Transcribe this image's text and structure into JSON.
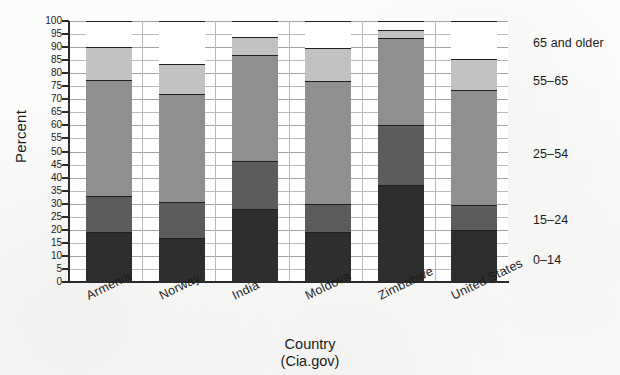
{
  "chart_data": {
    "type": "bar",
    "subtype": "stacked-bar-100-percent",
    "title": "",
    "xlabel": "Country",
    "source": "(Cia.gov)",
    "ylabel": "Percent",
    "ylim": [
      0,
      100
    ],
    "ytick_step": 5,
    "grid": true,
    "legend_position": "right",
    "categories": [
      "Armenia",
      "Norway",
      "India",
      "Moldova",
      "Zimbabwe",
      "United States"
    ],
    "series": [
      {
        "name": "0–14",
        "color": "#2e2e2e",
        "values": [
          19.0,
          17.0,
          28.0,
          19.0,
          37.0,
          20.0
        ]
      },
      {
        "name": "15–24",
        "color": "#5c5c5c",
        "values": [
          14.0,
          13.5,
          18.5,
          11.0,
          23.0,
          9.5
        ]
      },
      {
        "name": "25–54",
        "color": "#8f8f8f",
        "values": [
          44.5,
          41.5,
          40.5,
          47.0,
          33.5,
          44.0
        ]
      },
      {
        "name": "55–65",
        "color": "#c2c2c2",
        "values": [
          12.5,
          11.5,
          7.0,
          12.5,
          3.0,
          12.0
        ]
      },
      {
        "name": "65 and older",
        "color": "#ffffff",
        "values": [
          10.0,
          16.5,
          6.0,
          10.5,
          3.5,
          14.5
        ]
      }
    ],
    "cumulative_tops": {
      "Armenia": [
        19.0,
        33.0,
        77.5,
        90.0,
        100
      ],
      "Norway": [
        17.0,
        30.5,
        72.0,
        83.5,
        100
      ],
      "India": [
        28.0,
        46.5,
        87.0,
        94.0,
        100
      ],
      "Moldova": [
        19.0,
        30.0,
        77.0,
        89.5,
        100
      ],
      "Zimbabwe": [
        37.0,
        60.0,
        93.5,
        96.5,
        100
      ],
      "United States": [
        20.0,
        29.5,
        73.5,
        85.5,
        100
      ]
    },
    "ytick_labels": [
      "0",
      "5",
      "10",
      "15",
      "20",
      "25",
      "30",
      "35",
      "40",
      "45",
      "50",
      "55",
      "60",
      "65",
      "70",
      "75",
      "80",
      "85",
      "90",
      "95",
      "100"
    ],
    "legend_entries": [
      "65 and older",
      "55–65",
      "25–54",
      "15–24",
      "0–14"
    ]
  },
  "axes": {
    "y_title": "Percent",
    "x_title": "Country",
    "x_source": "(Cia.gov)"
  }
}
